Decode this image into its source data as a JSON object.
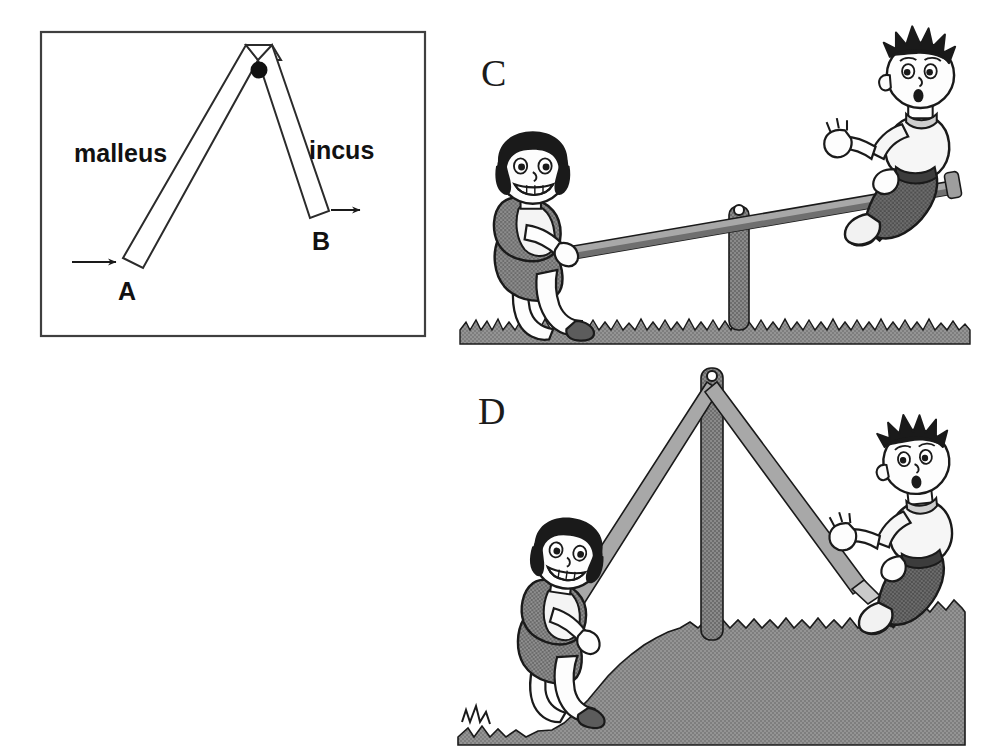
{
  "figure": {
    "background_color": "#ffffff",
    "panels": [
      {
        "id": "ossicle",
        "kind": "line-diagram",
        "frame": {
          "stroke": "#3a3a3a",
          "fill": "#ffffff"
        },
        "labels": {
          "malleus": "malleus",
          "incus": "incus",
          "point_a": "A",
          "point_b": "B"
        },
        "pivot": {
          "name": "fulcrum-dot",
          "color": "#111111"
        },
        "arrows": [
          {
            "name": "force-in-arrow",
            "at": "A",
            "direction": "right"
          },
          {
            "name": "force-out-arrow",
            "at": "B",
            "direction": "right"
          }
        ]
      },
      {
        "id": "seesaw-level-ground",
        "kind": "illustration",
        "letter": "C",
        "ground": "flat-grass",
        "fulcrum": {
          "name": "center-post",
          "position": "center"
        },
        "plank": {
          "name": "seesaw-plank",
          "tilt": "left-side-down"
        },
        "children": [
          {
            "name": "girl-child",
            "side": "left",
            "pose": "crouching-low"
          },
          {
            "name": "boy-child",
            "side": "right",
            "pose": "seated-high"
          }
        ]
      },
      {
        "id": "seesaw-hill-ground",
        "kind": "illustration",
        "letter": "D",
        "ground": "sloping-grass-hill",
        "fulcrum": {
          "name": "tall-center-post",
          "position": "center"
        },
        "plank": {
          "name": "bent-seesaw-plank",
          "tilt": "v-shaped-both-down"
        },
        "children": [
          {
            "name": "girl-child",
            "side": "left",
            "pose": "hanging-low"
          },
          {
            "name": "boy-child",
            "side": "right",
            "pose": "hanging-low"
          }
        ]
      }
    ],
    "colors": {
      "ink": "#111111",
      "frame_stroke": "#3a3a3a",
      "grass_fill": "#8d8d8d",
      "plank_fill": "#9a9a9a",
      "plank_shadow": "#6f6f6f",
      "post_fill": "#7b7b7b",
      "skin_fill": "#fdfdfd",
      "hair_fill": "#1a1a1a",
      "dark_cloth": "#6e6e6e",
      "light_cloth": "#f2f2f2",
      "mid_cloth": "#9d9d9d"
    }
  }
}
